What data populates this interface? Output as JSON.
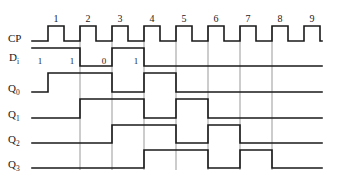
{
  "figure": {
    "background_color": "#ffffff",
    "line_color": "#1a1a1a",
    "refline_color": "#555555"
  },
  "labels": {
    "cp": "CP",
    "di_base": "D",
    "di_sub": "i",
    "q0_base": "Q",
    "q0_sub": "0",
    "q1_base": "Q",
    "q1_sub": "1",
    "q2_base": "Q",
    "q2_sub": "2",
    "q3_base": "Q",
    "q3_sub": "3"
  },
  "clock_numbers": [
    "1",
    "2",
    "3",
    "4",
    "5",
    "6",
    "7",
    "8",
    "9"
  ],
  "data_bits": [
    "1",
    "1",
    "0",
    "1"
  ],
  "chart_data": {
    "type": "line",
    "xlabel": "",
    "ylabel": "",
    "grid": false,
    "legend_position": "left",
    "time_axis": {
      "start_px": 32,
      "end_px": 322,
      "clock_period_px": 32,
      "first_rising_edge_px": 48,
      "pulse_high_width_px": 16,
      "num_clock_pulses": 9
    },
    "clock_numbers": [
      1,
      2,
      3,
      4,
      5,
      6,
      7,
      8,
      9
    ],
    "clock_number_x_px": [
      56,
      88,
      120,
      152,
      184,
      216,
      248,
      280,
      312
    ],
    "data_bit_labels": [
      {
        "value": "1",
        "x_px": 40
      },
      {
        "value": "1",
        "x_px": 72
      },
      {
        "value": "0",
        "x_px": 104
      },
      {
        "value": "1",
        "x_px": 136
      }
    ],
    "reference_lines_x_px": [
      80,
      112,
      144,
      176,
      208,
      240,
      272
    ],
    "series": [
      {
        "name": "CP",
        "row_y_high_px": 26,
        "row_y_low_px": 41,
        "description": "Clock, 9 pulses, period 32px, high for 16px",
        "transitions_px": [
          48,
          64,
          80,
          96,
          112,
          128,
          144,
          160,
          176,
          192,
          208,
          224,
          240,
          256,
          272,
          288,
          304,
          320
        ],
        "initial_level": "low"
      },
      {
        "name": "Di",
        "row_y_high_px": 48,
        "row_y_low_px": 66,
        "description": "Serial data input, bit pattern 1 1 0 1",
        "transitions_px": [
          80,
          112,
          144
        ],
        "initial_level": "high"
      },
      {
        "name": "Q0",
        "row_y_high_px": 73,
        "row_y_low_px": 92,
        "description": "First stage output, Di delayed one clock",
        "transitions_px": [
          48,
          112,
          144,
          176
        ],
        "initial_level": "low"
      },
      {
        "name": "Q1",
        "row_y_high_px": 99,
        "row_y_low_px": 118,
        "description": "Second stage output, Q0 delayed one clock",
        "transitions_px": [
          80,
          144,
          176,
          208
        ],
        "initial_level": "low"
      },
      {
        "name": "Q2",
        "row_y_high_px": 125,
        "row_y_low_px": 143,
        "description": "Third stage output, Q1 delayed one clock",
        "transitions_px": [
          112,
          176,
          208,
          240
        ],
        "initial_level": "low"
      },
      {
        "name": "Q3",
        "row_y_high_px": 150,
        "row_y_low_px": 168,
        "description": "Fourth stage output, Q2 delayed one clock",
        "transitions_px": [
          144,
          208,
          240,
          272
        ],
        "initial_level": "low"
      }
    ]
  }
}
